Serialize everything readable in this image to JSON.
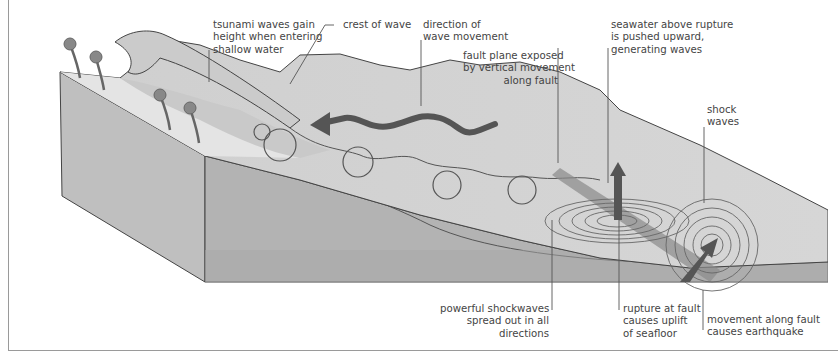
{
  "diagram": {
    "colors": {
      "background": "#ffffff",
      "block_front": "#b5b5b5",
      "block_side": "#c2c2c2",
      "seafloor_deep": "#a9a9a9",
      "water_surface": "#d9d9d9",
      "beach": "#e6e6e6",
      "arrow": "#555555",
      "lines": "#444444",
      "text": "#444444"
    },
    "labels": {
      "tsunami_height": [
        "tsunami waves gain",
        "height when entering",
        "shallow water"
      ],
      "crest": [
        "crest of wave"
      ],
      "direction": [
        "direction of",
        "wave movement"
      ],
      "fault_plane": [
        "fault plane exposed",
        "by vertical movement",
        "along fault"
      ],
      "seawater": [
        "seawater above rupture",
        "is pushed upward,",
        "generating waves"
      ],
      "shock_waves": [
        "shock",
        "waves"
      ],
      "powerful_shockwaves": [
        "powerful shockwaves",
        "spread out in all",
        "directions"
      ],
      "rupture": [
        "rupture at fault",
        "causes uplift",
        "of seafloor"
      ],
      "movement": [
        "movement along fault",
        "causes earthquake"
      ]
    },
    "elements": {
      "palm_trees": 4,
      "orbital_circles": 5,
      "shock_ring_sets": 2
    }
  }
}
